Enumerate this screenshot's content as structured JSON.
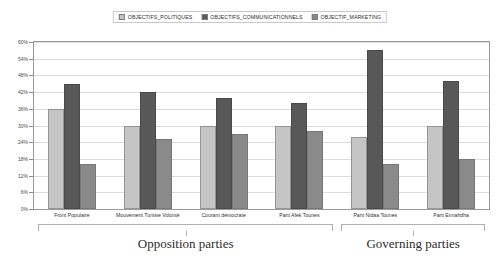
{
  "chart_data": {
    "type": "bar",
    "title": "",
    "xlabel": "",
    "ylabel": "",
    "ylim": [
      0,
      60
    ],
    "ytick_labels": [
      "0%",
      "6%",
      "12%",
      "18%",
      "24%",
      "30%",
      "36%",
      "42%",
      "48%",
      "54%",
      "60%"
    ],
    "ytick_values": [
      0,
      6,
      12,
      18,
      24,
      30,
      36,
      42,
      48,
      54,
      60
    ],
    "grid": true,
    "legend_position": "top-center",
    "categories": [
      "Front Populaire",
      "Mouvement Tunisie Volonté",
      "Courant démocrate",
      "Parti Afek Tounes",
      "Parti Nidaa Tounes",
      "Parti Ennahdha"
    ],
    "series": [
      {
        "name": "OBJECTIFS_POLITIQUES",
        "color": "#c5c5c5",
        "values": [
          36,
          30,
          30,
          30,
          26,
          30
        ]
      },
      {
        "name": "OBJECTIFS_COMMUNICATIONNELS",
        "color": "#585858",
        "values": [
          45,
          42,
          40,
          38,
          57,
          46
        ]
      },
      {
        "name": "OBJECTIF_MARKETING",
        "color": "#8a8a8a",
        "values": [
          16,
          25,
          27,
          28,
          16,
          18
        ]
      }
    ],
    "annotations": [
      {
        "label": "Opposition parties",
        "covers": [
          0,
          1,
          2,
          3
        ]
      },
      {
        "label": "Governing parties",
        "covers": [
          4,
          5
        ]
      }
    ]
  }
}
